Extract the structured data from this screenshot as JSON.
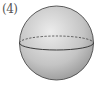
{
  "figure": {
    "label": "(4)",
    "shape": "sphere",
    "colors": {
      "outline": "#4a4a4a",
      "fill_light": "#e6e6e6",
      "fill_dark": "#9a9a9a"
    }
  }
}
